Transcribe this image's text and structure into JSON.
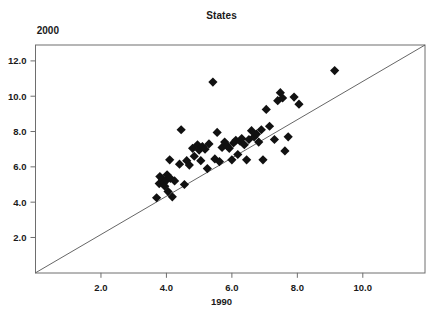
{
  "chart_data": {
    "type": "scatter",
    "title": "States",
    "xlabel": "1990",
    "ylabel": "2000",
    "xlim": [
      0,
      11.9
    ],
    "ylim": [
      0,
      12.9
    ],
    "xticks": [
      "2.0",
      "4.0",
      "6.0",
      "8.0",
      "10.0"
    ],
    "xtick_values": [
      2.0,
      4.0,
      6.0,
      8.0,
      10.0
    ],
    "yticks": [
      "2.0",
      "4.0",
      "6.0",
      "8.0",
      "10.0",
      "12.0"
    ],
    "ytick_values": [
      2.0,
      4.0,
      6.0,
      8.0,
      10.0,
      12.0
    ],
    "grid": false,
    "legend": "none",
    "marker": "diamond",
    "marker_color": "#111111",
    "reference_line": {
      "label": "y = x identity line",
      "from": [
        0,
        0
      ],
      "to": [
        11.9,
        12.9
      ],
      "color": "#555555"
    },
    "points": [
      [
        3.7,
        4.25
      ],
      [
        3.78,
        5.05
      ],
      [
        3.8,
        5.45
      ],
      [
        3.88,
        5.3
      ],
      [
        3.92,
        5.1
      ],
      [
        3.95,
        4.9
      ],
      [
        4.0,
        5.25
      ],
      [
        4.02,
        5.55
      ],
      [
        4.05,
        4.6
      ],
      [
        4.1,
        6.4
      ],
      [
        4.12,
        5.35
      ],
      [
        4.18,
        4.3
      ],
      [
        4.25,
        5.2
      ],
      [
        4.4,
        6.15
      ],
      [
        4.45,
        8.1
      ],
      [
        4.55,
        5.0
      ],
      [
        4.62,
        6.35
      ],
      [
        4.7,
        6.1
      ],
      [
        4.8,
        7.05
      ],
      [
        4.85,
        6.6
      ],
      [
        4.95,
        7.25
      ],
      [
        5.0,
        6.95
      ],
      [
        5.05,
        6.35
      ],
      [
        5.1,
        7.15
      ],
      [
        5.18,
        7.0
      ],
      [
        5.25,
        5.9
      ],
      [
        5.3,
        7.3
      ],
      [
        5.42,
        10.8
      ],
      [
        5.48,
        6.45
      ],
      [
        5.55,
        7.95
      ],
      [
        5.62,
        6.3
      ],
      [
        5.7,
        7.1
      ],
      [
        5.78,
        7.4
      ],
      [
        5.85,
        7.2
      ],
      [
        5.92,
        7.05
      ],
      [
        6.0,
        6.4
      ],
      [
        6.05,
        7.35
      ],
      [
        6.12,
        7.5
      ],
      [
        6.18,
        6.7
      ],
      [
        6.25,
        7.45
      ],
      [
        6.3,
        7.6
      ],
      [
        6.38,
        7.25
      ],
      [
        6.45,
        6.4
      ],
      [
        6.52,
        7.55
      ],
      [
        6.6,
        8.05
      ],
      [
        6.68,
        7.7
      ],
      [
        6.75,
        7.85
      ],
      [
        6.82,
        7.4
      ],
      [
        6.9,
        8.1
      ],
      [
        6.95,
        6.4
      ],
      [
        7.05,
        9.25
      ],
      [
        7.15,
        8.3
      ],
      [
        7.3,
        7.55
      ],
      [
        7.4,
        9.75
      ],
      [
        7.48,
        10.2
      ],
      [
        7.55,
        9.9
      ],
      [
        7.62,
        6.9
      ],
      [
        7.72,
        7.7
      ],
      [
        7.9,
        9.95
      ],
      [
        8.05,
        9.55
      ],
      [
        9.14,
        11.45
      ]
    ]
  }
}
